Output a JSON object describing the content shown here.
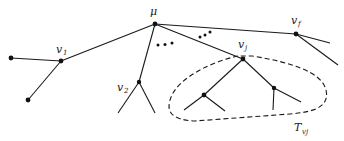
{
  "diagram": {
    "type": "tree",
    "nodes": [
      {
        "id": "mu",
        "label": "μ",
        "x": 155,
        "y": 24
      },
      {
        "id": "v1",
        "label": "v",
        "sub": "1",
        "x": 61,
        "y": 61
      },
      {
        "id": "v2",
        "label": "v",
        "sub": "2",
        "x": 139,
        "y": 82
      },
      {
        "id": "vj",
        "label": "v",
        "sub": "j",
        "x": 243,
        "y": 59
      },
      {
        "id": "vf",
        "label": "v",
        "sub": "f",
        "x": 296,
        "y": 34
      },
      {
        "id": "v1_leaf_a",
        "x": 11,
        "y": 58
      },
      {
        "id": "v1_leaf_b",
        "x": 28,
        "y": 100
      },
      {
        "id": "vj_child_a",
        "x": 204,
        "y": 95
      },
      {
        "id": "vj_child_b",
        "x": 274,
        "y": 88
      }
    ],
    "subtree_label": {
      "main": "T",
      "sub": "vj"
    },
    "ellipsis_marks": [
      "• • •",
      "• • •"
    ]
  }
}
